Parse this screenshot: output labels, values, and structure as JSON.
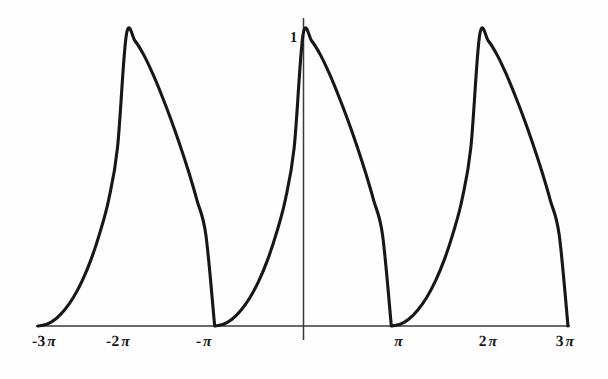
{
  "figure": {
    "kind": "mathematical-function-plot",
    "background_color": "#fefefe",
    "ink_color": "#171717",
    "axis_color": "#333333"
  },
  "chart_data": {
    "type": "line",
    "title": "",
    "subtitle": "",
    "xlabel": "",
    "ylabel": "",
    "grid": false,
    "legend": null,
    "legend_position": "none",
    "xlim": [
      -9.4248,
      9.4248
    ],
    "ylim": [
      0,
      1.0
    ],
    "x_tick_labels": [
      "-3 π",
      "-2 π",
      "-π",
      "π",
      "2 π",
      "3 π"
    ],
    "x_tick_values": [
      -9.4248,
      -6.2832,
      -3.1416,
      3.1416,
      6.2832,
      9.4248
    ],
    "y_tick_labels": [
      "1"
    ],
    "y_tick_values": [
      1
    ],
    "annotations": [
      {
        "text": "1",
        "x": 0,
        "y": 1,
        "note": "peak amplitude marked at y-axis"
      }
    ],
    "series": [
      {
        "name": "f(x)",
        "description": "periodic asymmetric pulse, period 2π, peak value 1 at even multiples of π, zero at odd multiples of π",
        "period": 6.2832,
        "peak_value": 1,
        "zero_points": [
          -9.4248,
          -3.1416,
          3.1416,
          9.4248
        ],
        "peak_points": [
          -6.2832,
          0,
          6.2832
        ],
        "x": [
          -9.4248,
          -9.1106,
          -8.7965,
          -8.4823,
          -8.1681,
          -7.854,
          -7.5398,
          -7.2257,
          -6.9115,
          -6.5973,
          -6.2832,
          -5.969,
          -5.6549,
          -5.3407,
          -5.0265,
          -4.7124,
          -4.3982,
          -4.0841,
          -3.7699,
          -3.4558,
          -3.1416,
          -2.8274,
          -2.5133,
          -2.1991,
          -1.885,
          -1.5708,
          -1.2566,
          -0.9425,
          -0.6283,
          -0.3142,
          0.0,
          0.3142,
          0.6283,
          0.9425,
          1.2566,
          1.5708,
          1.885,
          2.1991,
          2.5133,
          2.8274,
          3.1416,
          3.4558,
          3.7699,
          4.0841,
          4.3982,
          4.7124,
          5.0265,
          5.3407,
          5.6549,
          5.969,
          6.2832,
          6.5973,
          6.9115,
          7.2257,
          7.5398,
          7.854,
          8.1681,
          8.4823,
          8.7965,
          9.1106,
          9.4248
        ],
        "y": [
          0.0,
          0.006,
          0.024,
          0.055,
          0.098,
          0.155,
          0.228,
          0.32,
          0.434,
          0.613,
          1.0,
          0.979,
          0.93,
          0.866,
          0.793,
          0.714,
          0.628,
          0.535,
          0.432,
          0.314,
          0.0,
          0.006,
          0.024,
          0.055,
          0.098,
          0.155,
          0.228,
          0.32,
          0.434,
          0.613,
          1.0,
          0.979,
          0.93,
          0.866,
          0.793,
          0.714,
          0.628,
          0.535,
          0.432,
          0.314,
          0.0,
          0.006,
          0.024,
          0.055,
          0.098,
          0.155,
          0.228,
          0.32,
          0.434,
          0.613,
          1.0,
          0.979,
          0.93,
          0.866,
          0.793,
          0.714,
          0.628,
          0.535,
          0.432,
          0.314,
          0.0
        ]
      }
    ]
  },
  "axes": {
    "x_axis": {
      "name": "horizontal-axis",
      "pixel_y": 326,
      "pixel_x_start": 36,
      "pixel_x_end": 570
    },
    "y_axis": {
      "name": "vertical-axis",
      "pixel_x": 303,
      "pixel_y_top": 18,
      "pixel_y_bottom": 340
    },
    "ticks": [
      {
        "label_text": "-3",
        "pi": "π",
        "pixel_x": 44,
        "value": -9.4248
      },
      {
        "label_text": "-2",
        "pi": "π",
        "pixel_x": 118,
        "value": -6.2832
      },
      {
        "label_text": "-",
        "pi": "π",
        "pixel_x": 204,
        "value": -3.1416
      },
      {
        "label_text": "",
        "pi": "π",
        "pixel_x": 398,
        "value": 3.1416
      },
      {
        "label_text": "2",
        "pi": "π",
        "pixel_x": 488,
        "value": 6.2832
      },
      {
        "label_text": "3",
        "pi": "π",
        "pixel_x": 565,
        "value": 9.4248
      }
    ],
    "y_marker": {
      "label": "1",
      "pixel_x": 290,
      "pixel_y": 29
    }
  }
}
